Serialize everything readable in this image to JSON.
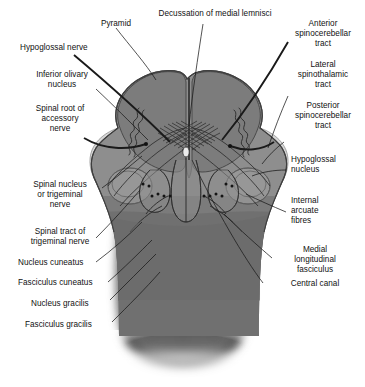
{
  "figure": {
    "type": "anatomical-cross-section",
    "background_color": "#ffffff",
    "palette": {
      "outline": "#3a3a3a",
      "dark_gray": "#6e6e6e",
      "mid_gray": "#8b8b8b",
      "light_gray": "#b8b8b8",
      "pale_gray": "#cfcfcf",
      "lightest": "#e2e2e2",
      "leader_line": "#1a1a1a",
      "label_text": "#111111"
    }
  },
  "labels": {
    "pyramid": "Pyramid",
    "decussation": "Decussation of medial lemnisci",
    "anterior_spinocerebellar": "Anterior\nspinocerebellar\ntract",
    "lateral_spinothalamic": "Lateral\nspinothalamic\ntract",
    "posterior_spinocerebellar": "Posterior\nspinocerebellar\ntract",
    "hypoglossal_nerve": "Hypoglossal nerve",
    "inferior_olivary_nucleus": "Inferior olivary\nnucleus",
    "spinal_root_accessory": "Spinal root of\naccessory\nnerve",
    "spinal_nucleus_trigeminal": "Spinal nucleus\nor trigeminal\nnerve",
    "spinal_tract_trigeminal": "Spinal tract of\ntrigeminal nerve",
    "nucleus_cuneatus": "Nucleus cuneatus",
    "fasciculus_cuneatus": "Fasciculus cuneatus",
    "nucleus_gracilis": "Nucleus gracilis",
    "fasciculus_gracilis": "Fasciculus gracilis",
    "hypoglossal_nucleus": "Hypoglossal\nnucleus",
    "internal_arcuate_fibres": "Internal\narcuate\nfibres",
    "medial_longitudinal_fasciculus": "Medial\nlongitudinal\nfasciculus",
    "central_canal": "Central canal"
  }
}
